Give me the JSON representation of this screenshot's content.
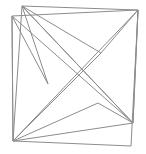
{
  "image": {
    "kind": "line-drawing",
    "subject": "pinwheel-star-in-quadrilateral",
    "background_color": "#ffffff",
    "stroke_color": "#8c8c8c",
    "stroke_width": 1,
    "canvas": {
      "width": 146,
      "height": 154
    }
  },
  "geometry": {
    "frame": {
      "name": "outer-quadrilateral",
      "points": "22,6 138,10 131,146 13,141",
      "corners": [
        {
          "label": "top-left",
          "x": 22,
          "y": 6
        },
        {
          "label": "top-right",
          "x": 138,
          "y": 10
        },
        {
          "label": "bottom-right",
          "x": 131,
          "y": 146
        },
        {
          "label": "bottom-left",
          "x": 13,
          "y": 141
        }
      ]
    },
    "inner_quadrilateral": {
      "name": "inner-quadrilateral",
      "points": "12,16 138,10 133,123 13,141",
      "corners": [
        {
          "label": "left-top",
          "x": 12,
          "y": 16
        },
        {
          "label": "right-top",
          "x": 138,
          "y": 10
        },
        {
          "label": "right-lower",
          "x": 133,
          "y": 123
        },
        {
          "label": "left-bottom",
          "x": 13,
          "y": 141
        }
      ]
    },
    "star": {
      "name": "pinwheel-star-outline",
      "points": "22,6 48,84 12,16 13,141 98,103 133,123 138,10 101,53",
      "vertices": [
        {
          "label": "tip-top-left",
          "x": 22,
          "y": 6
        },
        {
          "label": "notch-left",
          "x": 48,
          "y": 84
        },
        {
          "label": "tip-left-top",
          "x": 12,
          "y": 16
        },
        {
          "label": "tip-bottom-left",
          "x": 13,
          "y": 141
        },
        {
          "label": "notch-bottom",
          "x": 98,
          "y": 103
        },
        {
          "label": "tip-right-lower",
          "x": 133,
          "y": 123
        },
        {
          "label": "tip-top-right",
          "x": 138,
          "y": 10
        },
        {
          "label": "notch-right",
          "x": 101,
          "y": 53
        }
      ]
    },
    "chords": [
      {
        "name": "chord-topleft-to-bottomright",
        "x1": 22,
        "y1": 6,
        "x2": 133,
        "y2": 123
      },
      {
        "name": "chord-lefttop-to-bottomright",
        "x1": 12,
        "y1": 16,
        "x2": 133,
        "y2": 123
      },
      {
        "name": "chord-topright-to-bottomleft",
        "x1": 138,
        "y1": 10,
        "x2": 13,
        "y2": 141
      },
      {
        "name": "chord-notchright-to-bottomleft",
        "x1": 101,
        "y1": 53,
        "x2": 13,
        "y2": 141
      }
    ]
  }
}
